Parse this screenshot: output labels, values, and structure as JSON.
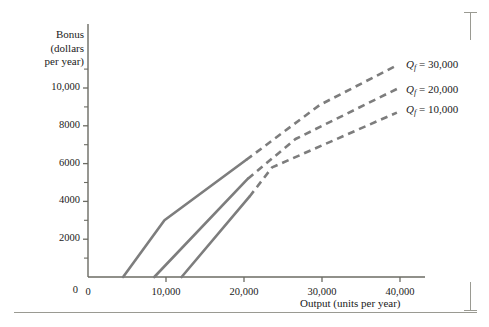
{
  "chart_data": {
    "type": "line",
    "title": "",
    "xlabel": "Output (units per year)",
    "ylabel": "Bonus (dollars per year)",
    "ylabel_lines": [
      "Bonus",
      "(dollars",
      "per year)"
    ],
    "xlim": [
      0,
      45000
    ],
    "ylim": [
      0,
      11600
    ],
    "grid": false,
    "legend_position": "right-inside",
    "x_ticks": [
      0,
      10000,
      20000,
      30000,
      40000
    ],
    "x_tick_labels": [
      "0",
      "10,000",
      "20,000",
      "30,000",
      "40,000"
    ],
    "x_minor_ticks": [
      5000,
      15000,
      25000,
      35000
    ],
    "y_ticks": [
      0,
      2000,
      4000,
      6000,
      8000,
      10000
    ],
    "y_tick_labels": [
      "0",
      "2000",
      "4000",
      "6000",
      "8000",
      "10,000"
    ],
    "y_minor_ticks": [
      1000,
      3000,
      5000,
      7000,
      9000,
      11000
    ],
    "line_color": "#7d7d7d",
    "axis_color": "#6b6b63",
    "series": [
      {
        "name": "Qf = 10,000",
        "legend_label": "Q_f = 10,000",
        "legend_symbol": "Q",
        "legend_subscript": "f",
        "legend_value": "= 10,000",
        "solid_points": [
          [
            4500,
            0
          ],
          [
            9800,
            3000
          ],
          [
            20300,
            6200
          ]
        ],
        "dashed_points": [
          [
            20300,
            6200
          ],
          [
            29700,
            9100
          ],
          [
            39600,
            11200
          ]
        ]
      },
      {
        "name": "Qf = 20,000",
        "legend_label": "Q_f = 20,000",
        "legend_symbol": "Q",
        "legend_subscript": "f",
        "legend_value": "= 20,000",
        "solid_points": [
          [
            8500,
            0
          ],
          [
            20500,
            5200
          ]
        ],
        "dashed_points": [
          [
            20500,
            5200
          ],
          [
            26600,
            7300
          ],
          [
            39600,
            9950
          ]
        ]
      },
      {
        "name": "Qf = 30,000",
        "legend_label": "Q_f = 30,000",
        "legend_symbol": "Q",
        "legend_subscript": "f",
        "legend_value": "= 30,000",
        "solid_points": [
          [
            12000,
            0
          ],
          [
            20700,
            4250
          ]
        ],
        "dashed_points": [
          [
            20700,
            4250
          ],
          [
            23600,
            5800
          ],
          [
            39600,
            8700
          ]
        ]
      }
    ]
  },
  "axes": {
    "y_title_line1": "Bonus",
    "y_title_line2": "(dollars",
    "y_title_line3": "per year)",
    "x_title": "Output (units per year)"
  }
}
